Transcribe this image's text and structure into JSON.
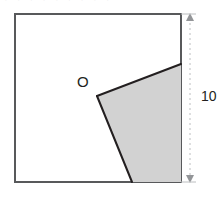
{
  "figure": {
    "type": "geometry-diagram",
    "canvas": {
      "width": 223,
      "height": 200
    },
    "background_color": "#ffffff",
    "square": {
      "name": "outer-square",
      "left": 14,
      "top": 13,
      "right": 181,
      "bottom": 182,
      "side_px": 167,
      "side_label": "10",
      "stroke_color": "#58595b",
      "stroke_width": 2,
      "fill_color": "#ffffff"
    },
    "shaded_region": {
      "name": "shaded-sector",
      "fill_color": "#d2d2d2",
      "stroke_color": "#231f20",
      "stroke_width": 2,
      "points": "97,96 181,64 181,182 132,182",
      "vertices": [
        {
          "label": "O",
          "x": 97,
          "y": 96
        },
        {
          "label": "",
          "x": 181,
          "y": 64
        },
        {
          "label": "",
          "x": 181,
          "y": 182
        },
        {
          "label": "",
          "x": 132,
          "y": 182
        }
      ]
    },
    "rays": {
      "name": "angle-rays",
      "stroke_color": "#231f20",
      "stroke_width": 2,
      "upper_ray": {
        "x1": 97,
        "y1": 96,
        "x2": 181,
        "y2": 64
      },
      "lower_ray": {
        "x1": 97,
        "y1": 96,
        "x2": 132,
        "y2": 182
      }
    },
    "vertex_label": {
      "name": "point-o",
      "text": "O"
    },
    "dimension": {
      "name": "height-dimension",
      "value": "10",
      "orientation": "vertical",
      "line_x": 190,
      "y_start": 14,
      "y_end": 182,
      "line_color": "#bcbec0",
      "dash": "2,3",
      "arrow_color": "#939598",
      "label": "10"
    },
    "top_fragment": {
      "name": "cropped-header-text",
      "text": "· · · · · · · · ·"
    }
  }
}
